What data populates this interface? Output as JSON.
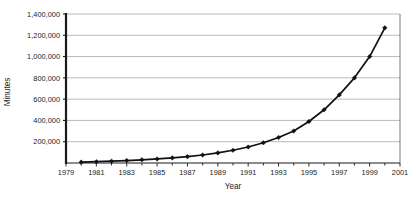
{
  "chart_data": {
    "type": "line",
    "title": "",
    "subtitle": "",
    "xlabel": "Year",
    "ylabel": "Minutes",
    "xlim": [
      1979,
      2001
    ],
    "ylim": [
      0,
      1400000
    ],
    "grid": true,
    "legend": false,
    "x_tick_labels": [
      "1979",
      "1981",
      "1983",
      "1985",
      "1987",
      "1989",
      "1991",
      "1993",
      "1995",
      "1997",
      "1999",
      "2001"
    ],
    "x_tick_values": [
      1979,
      1981,
      1983,
      1985,
      1987,
      1989,
      1991,
      1993,
      1995,
      1997,
      1999,
      2001
    ],
    "x_minor_ticks": [
      1980,
      1982,
      1984,
      1986,
      1988,
      1990,
      1992,
      1994,
      1996,
      1998,
      2000
    ],
    "y_tick_labels": [
      "200,000",
      "400,000",
      "600,000",
      "800,000",
      "1,000,000",
      "1,200,000",
      "1,400,000"
    ],
    "y_tick_values": [
      200000,
      400000,
      600000,
      800000,
      1000000,
      1200000,
      1400000
    ],
    "series": [
      {
        "name": "Minutes",
        "marker": "diamond",
        "color": "#111111",
        "x": [
          1980,
          1981,
          1982,
          1983,
          1984,
          1985,
          1986,
          1987,
          1988,
          1989,
          1990,
          1991,
          1992,
          1993,
          1994,
          1995,
          1996,
          1997,
          1998,
          1999,
          2000
        ],
        "values": [
          8000,
          12000,
          17000,
          23000,
          30000,
          38000,
          48000,
          60000,
          75000,
          95000,
          120000,
          150000,
          190000,
          240000,
          300000,
          390000,
          500000,
          640000,
          800000,
          1000000,
          1270000
        ]
      }
    ]
  }
}
